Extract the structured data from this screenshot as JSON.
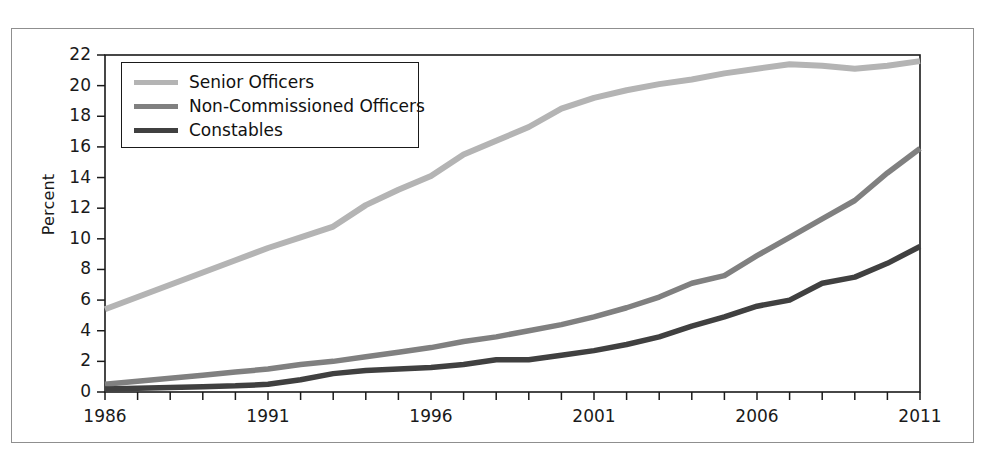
{
  "chart_data": {
    "type": "line",
    "title": "",
    "subtitle": "",
    "xlabel": "",
    "ylabel": "Percent",
    "xlim": [
      1986,
      2011
    ],
    "ylim": [
      0,
      22
    ],
    "yticks": [
      0,
      2,
      4,
      6,
      8,
      10,
      12,
      14,
      16,
      18,
      20,
      22
    ],
    "ytick_labels": [
      "0",
      "2",
      "4",
      "6",
      "8",
      "10",
      "12",
      "14",
      "16",
      "18",
      "20",
      "22"
    ],
    "xticks": [
      1986,
      1991,
      1996,
      2001,
      2006,
      2011
    ],
    "xtick_labels": [
      "1986",
      "1991",
      "1996",
      "2001",
      "2006",
      "2011"
    ],
    "x_minor_tick_interval": 1,
    "grid": false,
    "legend_position": "upper-left",
    "x": [
      1986,
      1987,
      1988,
      1989,
      1990,
      1991,
      1992,
      1993,
      1994,
      1995,
      1996,
      1997,
      1998,
      1999,
      2000,
      2001,
      2002,
      2003,
      2004,
      2005,
      2006,
      2007,
      2008,
      2009,
      2010,
      2011
    ],
    "series": [
      {
        "name": "Senior Officers",
        "color": "#b4b4b4",
        "values": [
          5.4,
          6.2,
          7.0,
          7.8,
          8.6,
          9.4,
          10.1,
          10.8,
          12.2,
          13.2,
          14.1,
          15.5,
          16.4,
          17.3,
          18.5,
          19.2,
          19.7,
          20.1,
          20.4,
          20.8,
          21.1,
          21.4,
          21.3,
          21.1,
          21.3,
          21.6
        ]
      },
      {
        "name": "Non-Commissioned Officers",
        "color": "#808080",
        "values": [
          0.5,
          0.7,
          0.9,
          1.1,
          1.3,
          1.5,
          1.8,
          2.0,
          2.3,
          2.6,
          2.9,
          3.3,
          3.6,
          4.0,
          4.4,
          4.9,
          5.5,
          6.2,
          7.1,
          7.6,
          8.9,
          10.1,
          11.3,
          12.5,
          14.3,
          15.9
        ]
      },
      {
        "name": "Constables",
        "color": "#404040",
        "values": [
          0.2,
          0.25,
          0.3,
          0.35,
          0.4,
          0.5,
          0.8,
          1.2,
          1.4,
          1.5,
          1.6,
          1.8,
          2.1,
          2.1,
          2.4,
          2.7,
          3.1,
          3.6,
          4.3,
          4.9,
          5.6,
          6.0,
          7.1,
          7.5,
          8.4,
          9.5
        ]
      }
    ]
  },
  "legend": {
    "items": [
      {
        "label": "Senior Officers",
        "color": "#b4b4b4"
      },
      {
        "label": "Non-Commissioned Officers",
        "color": "#808080"
      },
      {
        "label": "Constables",
        "color": "#404040"
      }
    ]
  },
  "axes": {
    "y_title": "Percent"
  }
}
